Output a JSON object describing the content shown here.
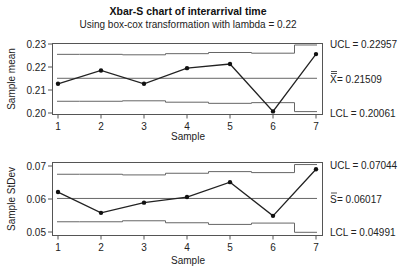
{
  "chart_data": [
    {
      "type": "line",
      "title": "Xbar-S chart of interarrival time",
      "subtitle": "Using box-cox transformation with lambda = 0.22",
      "xlabel": "Sample",
      "ylabel": "Sample mean",
      "x": [
        1,
        2,
        3,
        4,
        5,
        6,
        7
      ],
      "values": [
        0.2127,
        0.2185,
        0.2127,
        0.2195,
        0.2213,
        0.2007,
        0.2256
      ],
      "ylim": [
        0.2,
        0.23
      ],
      "yticks": [
        "0.20",
        "0.21",
        "0.22",
        "0.23"
      ],
      "xticks": [
        "1",
        "2",
        "3",
        "4",
        "5",
        "6",
        "7"
      ],
      "ucl_steps": [
        0.2255,
        0.2255,
        0.2253,
        0.2258,
        0.2263,
        0.226,
        0.22957
      ],
      "lcl_steps": [
        0.2051,
        0.2051,
        0.2053,
        0.2047,
        0.2042,
        0.2045,
        0.20061
      ],
      "center": 0.21509,
      "labels": {
        "ucl": "UCL = 0.22957",
        "center": "X̅̅ = 0.21509",
        "center_symbol": "X",
        "center_value": " = 0.21509",
        "lcl": "LCL = 0.20061"
      },
      "grid": false,
      "legend": "none"
    },
    {
      "type": "line",
      "xlabel": "Sample",
      "ylabel": "Sample StDev",
      "x": [
        1,
        2,
        3,
        4,
        5,
        6,
        7
      ],
      "values": [
        0.0621,
        0.0558,
        0.0589,
        0.0606,
        0.0651,
        0.0549,
        0.069
      ],
      "ylim": [
        0.05,
        0.07
      ],
      "yticks": [
        "0.05",
        "0.06",
        "0.07"
      ],
      "xticks": [
        "1",
        "2",
        "3",
        "4",
        "5",
        "6",
        "7"
      ],
      "ucl_steps": [
        0.0675,
        0.0675,
        0.0673,
        0.0678,
        0.0683,
        0.068,
        0.07044
      ],
      "lcl_steps": [
        0.0531,
        0.0531,
        0.0534,
        0.0528,
        0.0523,
        0.0527,
        0.04991
      ],
      "center": 0.06017,
      "labels": {
        "ucl": "UCL = 0.07044",
        "center": "S̅ = 0.06017",
        "center_symbol": "S",
        "center_value": " = 0.06017",
        "lcl": "LCL = 0.04991"
      },
      "grid": false,
      "legend": "none"
    }
  ]
}
